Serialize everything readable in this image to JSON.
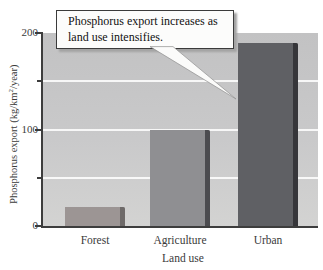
{
  "chart_data": {
    "type": "bar",
    "title": "",
    "categories": [
      "Forest",
      "Agriculture",
      "Urban"
    ],
    "values": [
      20,
      100,
      190
    ],
    "xlabel": "Land use",
    "ylabel": "Phosphorus export (kg/km2/year)",
    "ylabel_parts": {
      "pre": "Phosphorus export (kg/km",
      "sup": "2",
      "post": "/year)"
    },
    "ylim": [
      0,
      200
    ],
    "yticks_major": [
      {
        "value": 200,
        "label": "200"
      },
      {
        "value": 100,
        "label": "100"
      },
      {
        "value": 0,
        "label": "0"
      }
    ],
    "yticks_minor": [
      150,
      50
    ],
    "gridlines": [
      150,
      100,
      50
    ],
    "grid": true,
    "legend": null,
    "bar_colors": [
      "#9c9594",
      "#8f8f92",
      "#5f6064"
    ],
    "bar_edge_colors": [
      "#6e6a69",
      "#4c4c50",
      "#36363a"
    ],
    "annotation": {
      "line1": "Phosphorus export increases as",
      "line2": "land use intensifies.",
      "target": "Urban bar"
    },
    "colors": {
      "plot_bg_top": "#c2c2c3",
      "plot_bg_bottom": "#d3d3d2",
      "gridline": "#ffffff",
      "axis": "#3d3d3d",
      "callout_bg": "#fcfcfb",
      "callout_border": "#3b3b3b",
      "callout_shadow": "#a3a3a3"
    }
  }
}
